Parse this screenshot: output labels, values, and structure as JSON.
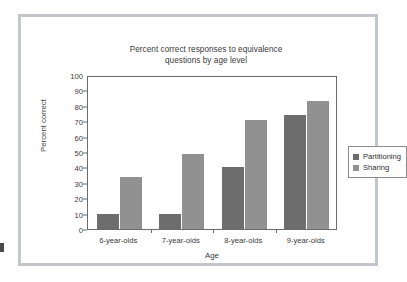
{
  "chart_data": {
    "type": "bar",
    "title": "Percent correct responses to equivalence questions by age level",
    "title_line1": "Percent correct responses to equivalence",
    "title_line2": "questions by age level",
    "xlabel": "Age",
    "ylabel": "Percent correct",
    "categories": [
      "6-year-olds",
      "7-year-olds",
      "8-year-olds",
      "9-year-olds"
    ],
    "series": [
      {
        "name": "Partitioning",
        "values": [
          10,
          10,
          40,
          74
        ],
        "color": "#6d6d6d"
      },
      {
        "name": "Sharing",
        "values": [
          34,
          49,
          71,
          83
        ],
        "color": "#919191"
      }
    ],
    "ylim": [
      0,
      100
    ],
    "ytick_step": 10,
    "ytick_labels": [
      "0",
      "10",
      "20",
      "30",
      "40",
      "50",
      "60",
      "70",
      "80",
      "90",
      "100"
    ],
    "grid": false,
    "legend_position": "right"
  },
  "legend": {
    "items": [
      {
        "label": "Partitioning",
        "color": "#6d6d6d"
      },
      {
        "label": "Sharing",
        "color": "#919191"
      }
    ]
  },
  "frame": {
    "border_color": "#c3c7cc",
    "background": "#ffffff"
  }
}
